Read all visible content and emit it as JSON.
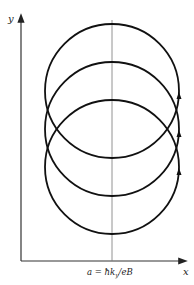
{
  "diagram": {
    "axes": {
      "y_label": "y",
      "x_label": "x"
    },
    "center_line_label": "a = ħk",
    "center_line_label_sub": "y",
    "center_line_label_tail": "/eB",
    "orbit_count": 3,
    "arrow_direction": "up",
    "colors": {
      "stroke": "#111111",
      "axis": "#333333",
      "center_line": "#777777"
    }
  }
}
